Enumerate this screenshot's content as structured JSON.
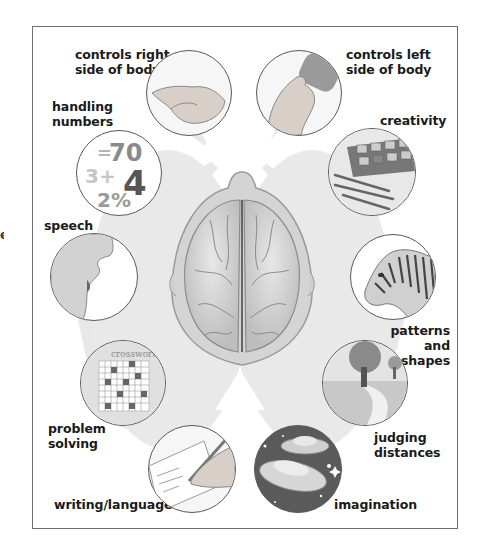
{
  "diagram": {
    "center_image": "brain-top-view",
    "left_hemisphere_functions": [
      {
        "id": "controls-right-side",
        "label": "controls right\nside of body",
        "icon": "pinching-hand-icon"
      },
      {
        "id": "handling-numbers",
        "label": "handling\nnumbers",
        "icon": "numbers-icon",
        "icon_text": [
          "=70",
          "3+",
          "4",
          "2%"
        ]
      },
      {
        "id": "speech",
        "label": "speech",
        "icon": "mouth-speaking-icon"
      },
      {
        "id": "problem-solving",
        "label": "problem\nsolving",
        "icon": "crossword-icon",
        "icon_text": "crossword"
      },
      {
        "id": "writing-language",
        "label": "writing/language",
        "icon": "hand-writing-icon"
      }
    ],
    "right_hemisphere_functions": [
      {
        "id": "controls-left-side",
        "label": "controls left\nside of body",
        "icon": "hand-holding-eraser-icon"
      },
      {
        "id": "creativity",
        "label": "creativity",
        "icon": "paint-palette-icon"
      },
      {
        "id": "patterns-shapes",
        "label": "patterns\nand\nshapes",
        "icon": "zebra-icon"
      },
      {
        "id": "judging-distances",
        "label": "judging\ndistances",
        "icon": "landscape-path-icon"
      },
      {
        "id": "imagination",
        "label": "imagination",
        "icon": "flying-saucer-icon"
      }
    ],
    "colors": {
      "frame_border": "#6e6e6e",
      "beam_gray": "#e6e6e6",
      "brain_gray": "#cfcfcf",
      "label_text": "#1a1a1a"
    }
  }
}
